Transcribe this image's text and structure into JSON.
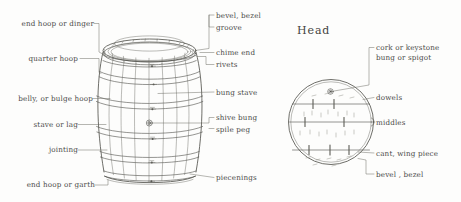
{
  "figure": {
    "style": "hand-drawn pen sketch",
    "ink_color": "#4a4a48",
    "paper_color": "#fdfdfc"
  },
  "barrel": {
    "name": "barrel",
    "left_labels": [
      {
        "id": "end-hoop-or-dinger",
        "text": "end hoop or dinger"
      },
      {
        "id": "quarter-hoop",
        "text": "quarter hoop"
      },
      {
        "id": "belly-or-bulge-hoop",
        "text": "belly, or bulge hoop"
      },
      {
        "id": "stave-or-lag",
        "text": "stave  or lag"
      },
      {
        "id": "jointing",
        "text": "jointing"
      },
      {
        "id": "end-hoop-or-garth",
        "text": "end hoop or garth"
      }
    ],
    "right_labels": [
      {
        "id": "bevel-bezel",
        "text": "bevel, bezel"
      },
      {
        "id": "groove",
        "text": "groove"
      },
      {
        "id": "chime-end",
        "text": "chime  end"
      },
      {
        "id": "rivets",
        "text": "rivets"
      },
      {
        "id": "bung-stave",
        "text": "bung stave"
      },
      {
        "id": "shive-bung",
        "text": "shive bung"
      },
      {
        "id": "spile-peg",
        "text": "spile  peg"
      },
      {
        "id": "piecenings",
        "text": "piecenings"
      }
    ]
  },
  "head": {
    "title": "Head",
    "labels": [
      {
        "id": "cork-or-keystone-bung-or-spigot",
        "line1": "cork or keystone",
        "line2": "bung  or  spigot"
      },
      {
        "id": "dowels",
        "text": "dowels"
      },
      {
        "id": "middles",
        "text": "middles"
      },
      {
        "id": "cant-wing-piece",
        "text": "cant, wing piece"
      },
      {
        "id": "bevel-bezel-head",
        "text": "bevel ,  bezel"
      }
    ]
  }
}
